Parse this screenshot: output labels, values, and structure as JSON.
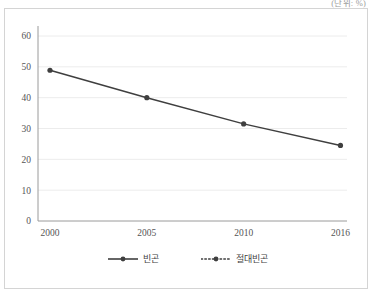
{
  "unit_note": "(단위: %)",
  "legend": {
    "position": "bottom-center",
    "items": [
      {
        "label": "빈곤",
        "style": "solid",
        "icon": "solid-line-marker-icon"
      },
      {
        "label": "절대빈곤",
        "style": "dotted",
        "icon": "dotted-line-marker-icon"
      }
    ]
  },
  "colors": {
    "series": "#3f3f3f",
    "grid": "#ececec",
    "axis": "#9a9a9a",
    "frame": "#d4d4d4",
    "text": "#555555"
  },
  "chart_data": {
    "type": "line",
    "title": "",
    "subtitle": "",
    "xlabel": "",
    "ylabel": "",
    "unit": "(단위: %)",
    "categories": [
      "2000",
      "2005",
      "2010",
      "2016"
    ],
    "x_tick_labels": [
      "2000",
      "2005",
      "2010",
      "2016"
    ],
    "y_tick_labels": [
      "0",
      "10",
      "20",
      "30",
      "40",
      "50",
      "60"
    ],
    "y_ticks": [
      0,
      10,
      20,
      30,
      40,
      50,
      60
    ],
    "ylim": [
      0,
      60
    ],
    "grid": "horizontal",
    "legend_position": "bottom-center",
    "series": [
      {
        "name": "빈곤",
        "style": "solid",
        "marker": "circle",
        "values": [
          48.9,
          40.0,
          31.5,
          24.5
        ],
        "data_labels": [
          "48.9",
          "40.0",
          "31.5",
          "24.5"
        ],
        "label_placement": [
          "above-left",
          "above",
          "above",
          "above"
        ]
      },
      {
        "name": "절대빈곤",
        "style": "dotted",
        "marker": "circle",
        "values": [
          34.3,
          25.1,
          17.6,
          13.0
        ],
        "data_labels": [
          "34.3",
          "25.1",
          "17.6",
          "13.0"
        ],
        "label_placement": [
          "below-left",
          "below",
          "below",
          "below"
        ]
      }
    ]
  }
}
